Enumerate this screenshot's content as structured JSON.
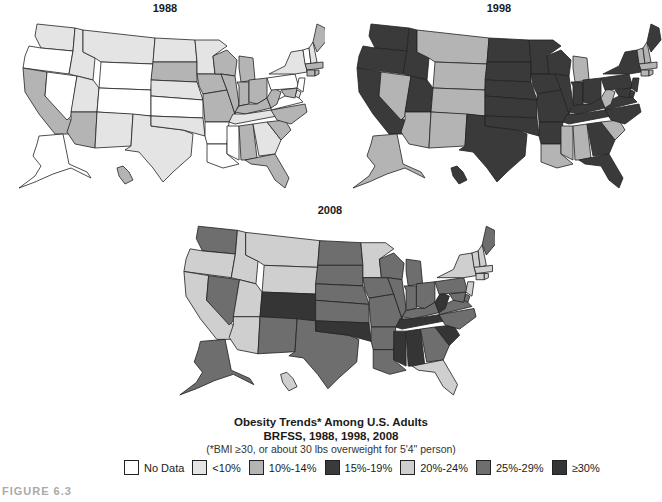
{
  "figure_label": "FIGURE 6.3",
  "caption": {
    "title": "Obesity Trends* Among U.S. Adults",
    "subtitle": "BRFSS, 1988, 1998, 2008",
    "note": "(*BMI ≥30, or about 30 lbs overweight for 5'4\" person)"
  },
  "legend": [
    {
      "key": "nd",
      "label": "No Data",
      "color": "#ffffff"
    },
    {
      "key": "a",
      "label": "<10%",
      "color": "#e4e4e4"
    },
    {
      "key": "b",
      "label": "10%-14%",
      "color": "#b4b4b4"
    },
    {
      "key": "c",
      "label": "15%-19%",
      "color": "#3a3a3a"
    },
    {
      "key": "d",
      "label": "20%-24%",
      "color": "#cfcfcf"
    },
    {
      "key": "e",
      "label": "25%-29%",
      "color": "#6e6e6e"
    },
    {
      "key": "f",
      "label": "≥30%",
      "color": "#353535"
    }
  ],
  "maps": [
    {
      "year": "1988",
      "title": "1988"
    },
    {
      "year": "1998",
      "title": "1998"
    },
    {
      "year": "2008",
      "title": "2008"
    }
  ],
  "chart_data": {
    "type": "heatmap",
    "title": "Obesity Trends* Among U.S. Adults",
    "subtitle": "BRFSS, 1988, 1998, 2008",
    "note": "(*BMI ≥30, or about 30 lbs overweight for 5'4\" person)",
    "legend": [
      "No Data",
      "<10%",
      "10%-14%",
      "15%-19%",
      "20%-24%",
      "25%-29%",
      "≥30%"
    ],
    "years": [
      "1988",
      "1998",
      "2008"
    ],
    "states": {
      "WA": [
        "a",
        "c",
        "e"
      ],
      "OR": [
        "nd",
        "c",
        "d"
      ],
      "CA": [
        "b",
        "c",
        "d"
      ],
      "NV": [
        "nd",
        "b",
        "e"
      ],
      "ID": [
        "a",
        "c",
        "d"
      ],
      "MT": [
        "a",
        "b",
        "d"
      ],
      "WY": [
        "nd",
        "b",
        "d"
      ],
      "UT": [
        "a",
        "c",
        "d"
      ],
      "CO": [
        "nd",
        "b",
        "f"
      ],
      "AZ": [
        "b",
        "b",
        "d"
      ],
      "NM": [
        "a",
        "b",
        "e"
      ],
      "TX": [
        "a",
        "c",
        "e"
      ],
      "ND": [
        "a",
        "c",
        "e"
      ],
      "SD": [
        "b",
        "c",
        "e"
      ],
      "NE": [
        "a",
        "c",
        "e"
      ],
      "KS": [
        "nd",
        "c",
        "e"
      ],
      "OK": [
        "a",
        "c",
        "f"
      ],
      "MN": [
        "a",
        "c",
        "d"
      ],
      "IA": [
        "b",
        "c",
        "e"
      ],
      "MO": [
        "b",
        "c",
        "e"
      ],
      "AR": [
        "nd",
        "c",
        "e"
      ],
      "LA": [
        "nd",
        "b",
        "e"
      ],
      "WI": [
        "b",
        "c",
        "e"
      ],
      "IL": [
        "b",
        "c",
        "e"
      ],
      "MI": [
        "b",
        "b",
        "e"
      ],
      "IN": [
        "b",
        "c",
        "e"
      ],
      "OH": [
        "b",
        "c",
        "e"
      ],
      "KY": [
        "b",
        "c",
        "e"
      ],
      "TN": [
        "a",
        "c",
        "f"
      ],
      "MS": [
        "nd",
        "b",
        "f"
      ],
      "AL": [
        "b",
        "b",
        "f"
      ],
      "GA": [
        "a",
        "c",
        "e"
      ],
      "FL": [
        "b",
        "c",
        "d"
      ],
      "SC": [
        "b",
        "b",
        "f"
      ],
      "NC": [
        "b",
        "c",
        "e"
      ],
      "VA": [
        "nd",
        "c",
        "e"
      ],
      "WV": [
        "b",
        "b",
        "f"
      ],
      "PA": [
        "nd",
        "c",
        "e"
      ],
      "NY": [
        "a",
        "c",
        "d"
      ],
      "VT": [
        "nd",
        "b",
        "d"
      ],
      "NH": [
        "a",
        "b",
        "d"
      ],
      "ME": [
        "b",
        "c",
        "e"
      ],
      "MA": [
        "b",
        "b",
        "d"
      ],
      "CT": [
        "b",
        "b",
        "d"
      ],
      "RI": [
        "b",
        "b",
        "d"
      ],
      "NJ": [
        "nd",
        "c",
        "d"
      ],
      "DE": [
        "a",
        "c",
        "e"
      ],
      "MD": [
        "b",
        "c",
        "e"
      ],
      "AK": [
        "nd",
        "b",
        "e"
      ],
      "HI": [
        "b",
        "c",
        "d"
      ]
    }
  }
}
